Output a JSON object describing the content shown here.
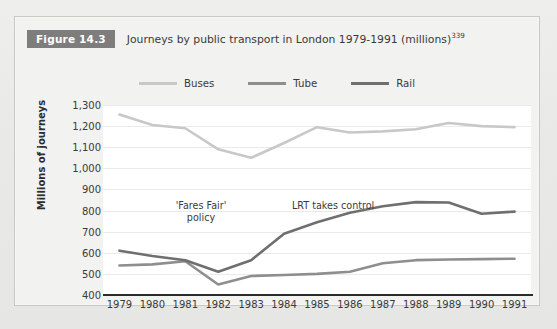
{
  "figure": {
    "badge": "Figure 14.3",
    "caption": "Journeys by public transport in London 1979-1991 (millions)",
    "caption_superscript": "339"
  },
  "colors": {
    "buses": "#c8c8c8",
    "tube": "#8e8e8e",
    "rail": "#6f6f6f",
    "badge_bg": "#7d7d7d",
    "panel_bg": "#ffffff",
    "card_bg": "#f2f2f0",
    "gridline": "#eaeaea",
    "axis": "#2b2b2b",
    "text": "#3a3a3a"
  },
  "annotations": [
    {
      "id": "fares-fair",
      "line1": "'Fares Fair'",
      "line2": "policy"
    },
    {
      "id": "lrt",
      "line1": "LRT takes control",
      "line2": ""
    }
  ],
  "chart_data": {
    "type": "line",
    "title": "Journeys by public transport in London 1979-1991 (millions)",
    "xlabel": "",
    "ylabel": "Millions of journeys",
    "categories": [
      "1979",
      "1980",
      "1981",
      "1982",
      "1983",
      "1984",
      "1985",
      "1986",
      "1987",
      "1988",
      "1989",
      "1990",
      "1991"
    ],
    "x": [
      1979,
      1980,
      1981,
      1982,
      1983,
      1984,
      1985,
      1986,
      1987,
      1988,
      1989,
      1990,
      1991
    ],
    "ylim": [
      400,
      1300
    ],
    "ytick_labels": [
      "400",
      "500",
      "600",
      "700",
      "800",
      "900",
      "1,000",
      "1,100",
      "1,200",
      "1,300"
    ],
    "yticks": [
      400,
      500,
      600,
      700,
      800,
      900,
      1000,
      1100,
      1200,
      1300
    ],
    "grid": true,
    "legend_position": "top-center",
    "series": [
      {
        "name": "Buses",
        "color": "#c8c8c8",
        "values": [
          1255,
          1205,
          1190,
          1090,
          1050,
          1120,
          1195,
          1170,
          1175,
          1185,
          1215,
          1200,
          1195
        ]
      },
      {
        "name": "Tube",
        "color": "#8e8e8e",
        "values": [
          540,
          545,
          560,
          450,
          490,
          495,
          500,
          510,
          550,
          565,
          568,
          570,
          572
        ]
      },
      {
        "name": "Rail",
        "color": "#6f6f6f",
        "values": [
          610,
          585,
          565,
          510,
          565,
          690,
          745,
          790,
          820,
          840,
          838,
          785,
          795
        ]
      }
    ],
    "annotations": [
      {
        "text": "'Fares Fair' policy",
        "x": 1981.5,
        "y": 900
      },
      {
        "text": "LRT takes control",
        "x": 1984.1,
        "y": 900
      }
    ]
  },
  "legend": {
    "items": [
      {
        "label": "Buses",
        "color": "#c8c8c8"
      },
      {
        "label": "Tube",
        "color": "#8e8e8e"
      },
      {
        "label": "Rail",
        "color": "#6f6f6f"
      }
    ]
  }
}
